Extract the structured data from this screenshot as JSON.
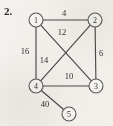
{
  "figure": {
    "problem_number": "2.",
    "type": "weighted-undirected-graph",
    "background_color": "#f4f2ee",
    "line_color": "#4a4a4a",
    "node_fill": "#f7f6f2",
    "node_stroke": "#5a5a5a"
  },
  "graph_data": {
    "type": "graph",
    "directed": false,
    "weighted": true,
    "nodes": [
      {
        "id": "1",
        "label": "1",
        "x": 36,
        "y": 20,
        "r": 7
      },
      {
        "id": "2",
        "label": "2",
        "x": 95,
        "y": 20,
        "r": 7
      },
      {
        "id": "3",
        "label": "3",
        "x": 96,
        "y": 86,
        "r": 7
      },
      {
        "id": "4",
        "label": "4",
        "x": 36,
        "y": 86,
        "r": 7
      },
      {
        "id": "5",
        "label": "5",
        "x": 69,
        "y": 114,
        "r": 7
      }
    ],
    "edges": [
      {
        "from": "1",
        "to": "2",
        "weight": "4",
        "label_x": 64,
        "label_y": 13
      },
      {
        "from": "1",
        "to": "3",
        "weight": "12",
        "label_x": 62,
        "label_y": 32
      },
      {
        "from": "1",
        "to": "4",
        "weight": "16",
        "label_x": 25,
        "label_y": 51
      },
      {
        "from": "2",
        "to": "4",
        "weight": "14",
        "label_x": 44,
        "label_y": 60
      },
      {
        "from": "2",
        "to": "3",
        "weight": "6",
        "label_x": 101,
        "label_y": 53
      },
      {
        "from": "3",
        "to": "4",
        "weight": "10",
        "label_x": 69,
        "label_y": 76
      },
      {
        "from": "4",
        "to": "5",
        "weight": "40",
        "label_x": 45,
        "label_y": 104
      }
    ]
  }
}
